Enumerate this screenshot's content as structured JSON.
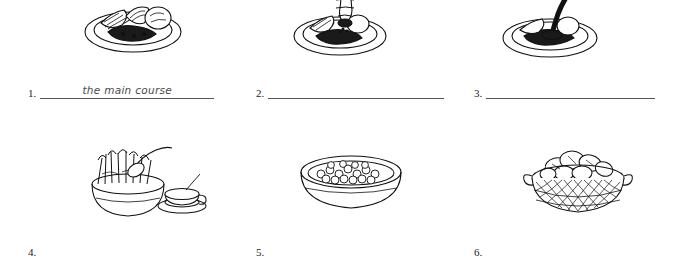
{
  "worksheet": {
    "rows": [
      {
        "pictures": [
          {
            "alt": "plate-of-food-main-course"
          },
          {
            "alt": "plate-with-pepper-grinder"
          },
          {
            "alt": "plate-with-sauce-being-poured"
          }
        ],
        "answers": [
          {
            "number": "1.",
            "value": "the main course"
          },
          {
            "number": "2.",
            "value": ""
          },
          {
            "number": "3.",
            "value": ""
          }
        ]
      },
      {
        "pictures": [
          {
            "alt": "bowl-of-fries-with-spoon-and-cup"
          },
          {
            "alt": "oval-dish-of-peas"
          },
          {
            "alt": "basket-of-bread-rolls"
          }
        ],
        "answers": [
          {
            "number": "4.",
            "value": ""
          },
          {
            "number": "5.",
            "value": ""
          },
          {
            "number": "6.",
            "value": ""
          }
        ]
      }
    ]
  },
  "colors": {
    "ink": "#1a1a1a",
    "rule": "#555555",
    "handwriting": "#4a4a4a",
    "paper": "#ffffff"
  }
}
